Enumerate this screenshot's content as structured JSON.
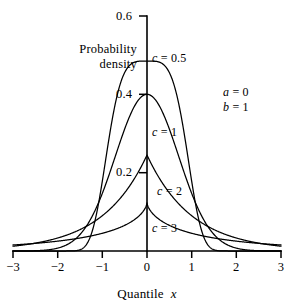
{
  "figure": {
    "kind": "probability-density-plot",
    "background_color": "#ffffff",
    "line_color": "#000000"
  },
  "axes": {
    "y_axis_label_line1": "Probability",
    "y_axis_label_line2": "density",
    "x_axis_title_text": "Quantile",
    "x_axis_title_symbol": "x",
    "y_ticks": [
      "0.6",
      "0.4",
      "0.2"
    ],
    "x_ticks": [
      "−3",
      "−2",
      "−1",
      "0",
      "1",
      "2",
      "3"
    ]
  },
  "annotations": {
    "curve_labels": [
      "c = 0.5",
      "c = 1",
      "c = 2",
      "c = 3"
    ],
    "curve_label_symbol": "c",
    "curve_label_values": [
      "0.5",
      "1",
      "2",
      "3"
    ],
    "parameters": [
      "a = 0",
      "b = 1"
    ],
    "param_a_symbol": "a",
    "param_a_value": "0",
    "param_b_symbol": "b",
    "param_b_value": "1"
  },
  "chart_data": {
    "type": "line",
    "title": "",
    "subtitle": "",
    "xlabel": "Quantile x",
    "ylabel": "Probability density",
    "xlim": [
      -3,
      3
    ],
    "ylim": [
      0,
      0.6
    ],
    "xticks": [
      -3,
      -2,
      -1,
      0,
      1,
      2,
      3
    ],
    "xticklabels": [
      "−3",
      "−2",
      "−1",
      "0",
      "1",
      "2",
      "3"
    ],
    "yticks": [
      0.2,
      0.4,
      0.6
    ],
    "yticklabels": [
      "0.2",
      "0.4",
      "0.6"
    ],
    "grid": false,
    "legend": "inline-curve-labels",
    "annotations": [
      {
        "text": "a = 0",
        "x": 2.0,
        "y": 0.52
      },
      {
        "text": "b = 1",
        "x": 2.0,
        "y": 0.485
      }
    ],
    "distribution": "generalized error (exponential power) density, a = 0, b = 1",
    "series": [
      {
        "name": "c = 0.5",
        "label": "c = 0.5",
        "c": 0.5,
        "peak_value": 0.485,
        "x": [
          -3.0,
          -2.75,
          -2.5,
          -2.25,
          -2.0,
          -1.75,
          -1.5,
          -1.4,
          -1.3,
          -1.2,
          -1.1,
          -1.0,
          -0.9,
          -0.8,
          -0.7,
          -0.6,
          -0.5,
          -0.4,
          -0.3,
          -0.2,
          -0.1,
          0.0,
          0.1,
          0.2,
          0.3,
          0.4,
          0.5,
          0.6,
          0.7,
          0.8,
          0.9,
          1.0,
          1.1,
          1.2,
          1.3,
          1.4,
          1.5,
          1.75,
          2.0,
          2.25,
          2.5,
          2.75,
          3.0
        ],
        "y": [
          0.0,
          0.0,
          0.0,
          0.0,
          0.001,
          0.004,
          0.022,
          0.042,
          0.074,
          0.122,
          0.186,
          0.262,
          0.317,
          0.369,
          0.411,
          0.443,
          0.464,
          0.477,
          0.483,
          0.485,
          0.485,
          0.485,
          0.485,
          0.485,
          0.483,
          0.477,
          0.464,
          0.443,
          0.411,
          0.369,
          0.317,
          0.262,
          0.186,
          0.122,
          0.074,
          0.042,
          0.022,
          0.004,
          0.001,
          0.0,
          0.0,
          0.0,
          0.0
        ]
      },
      {
        "name": "c = 1",
        "label": "c = 1",
        "c": 1.0,
        "peak_value": 0.4,
        "x": [
          -3.0,
          -2.75,
          -2.5,
          -2.25,
          -2.0,
          -1.75,
          -1.5,
          -1.25,
          -1.0,
          -0.75,
          -0.5,
          -0.25,
          0.0,
          0.25,
          0.5,
          0.75,
          1.0,
          1.25,
          1.5,
          1.75,
          2.0,
          2.25,
          2.5,
          2.75,
          3.0
        ],
        "y": [
          0.004,
          0.009,
          0.018,
          0.032,
          0.054,
          0.086,
          0.13,
          0.183,
          0.242,
          0.301,
          0.352,
          0.387,
          0.4,
          0.387,
          0.352,
          0.301,
          0.242,
          0.183,
          0.13,
          0.086,
          0.054,
          0.032,
          0.018,
          0.009,
          0.004
        ]
      },
      {
        "name": "c = 2",
        "label": "c = 2",
        "c": 2.0,
        "peak_value": 0.245,
        "x": [
          -3.0,
          -2.75,
          -2.5,
          -2.25,
          -2.0,
          -1.75,
          -1.5,
          -1.25,
          -1.0,
          -0.75,
          -0.5,
          -0.25,
          0.0,
          0.25,
          0.5,
          0.75,
          1.0,
          1.25,
          1.5,
          1.75,
          2.0,
          2.25,
          2.5,
          2.75,
          3.0
        ],
        "y": [
          0.025,
          0.031,
          0.04,
          0.052,
          0.066,
          0.085,
          0.11,
          0.14,
          0.18,
          0.116,
          0.149,
          0.191,
          0.245,
          0.191,
          0.149,
          0.116,
          0.09,
          0.07,
          0.055,
          0.042,
          0.033,
          0.026,
          0.02,
          0.016,
          0.012
        ]
      },
      {
        "name": "c = 3",
        "label": "c = 3",
        "c": 3.0,
        "peak_value": 0.123,
        "x": [
          -3.0,
          -2.75,
          -2.5,
          -2.25,
          -2.0,
          -1.75,
          -1.5,
          -1.25,
          -1.0,
          -0.75,
          -0.5,
          -0.25,
          0.0,
          0.25,
          0.5,
          0.75,
          1.0,
          1.25,
          1.5,
          1.75,
          2.0,
          2.25,
          2.5,
          2.75,
          3.0
        ],
        "y": [
          0.036,
          0.039,
          0.043,
          0.047,
          0.052,
          0.058,
          0.065,
          0.073,
          0.083,
          0.094,
          0.104,
          0.114,
          0.123,
          0.114,
          0.104,
          0.094,
          0.083,
          0.073,
          0.065,
          0.058,
          0.052,
          0.047,
          0.043,
          0.039,
          0.036
        ]
      }
    ]
  }
}
